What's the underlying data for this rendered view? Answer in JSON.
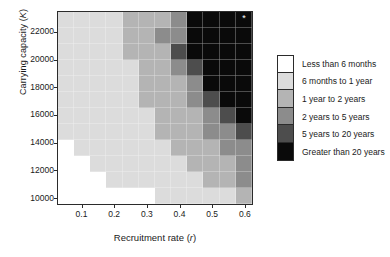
{
  "chart_data": {
    "type": "heatmap",
    "title": "",
    "xlabel": "Recruitment rate (r)",
    "ylabel": "Carrying capacity (K)",
    "xlabel_text": "Recruitment rate (",
    "xlabel_var": "r",
    "ylabel_text": "Carrying capacity (",
    "ylabel_var": "K",
    "xticks": [
      "0.1",
      "0.2",
      "0.3",
      "0.4",
      "0.5",
      "0.6"
    ],
    "xtick_values": [
      0.1,
      0.2,
      0.3,
      0.4,
      0.5,
      0.6
    ],
    "yticks": [
      "10000",
      "12000",
      "14000",
      "16000",
      "18000",
      "20000",
      "22000"
    ],
    "ytick_values": [
      10000,
      12000,
      14000,
      16000,
      18000,
      20000,
      22000
    ],
    "xlim": [
      0.025,
      0.625
    ],
    "ylim": [
      9500,
      23500
    ],
    "grid": true,
    "legend_position": "right",
    "ncols": 12,
    "nrows": 12,
    "x_centers": [
      0.05,
      0.1,
      0.15,
      0.2,
      0.25,
      0.3,
      0.35,
      0.4,
      0.45,
      0.5,
      0.55,
      0.6
    ],
    "y_centers": [
      23200,
      22000,
      20800,
      19600,
      18400,
      17200,
      16000,
      14800,
      13600,
      12400,
      11200,
      10000
    ],
    "value_levels": [
      0,
      1,
      2,
      3,
      4,
      5
    ],
    "colors": [
      "#ffffff",
      "#dcdcdc",
      "#b4b4b4",
      "#8c8c8c",
      "#4d4d4d",
      "#0a0a0a"
    ],
    "grid_values": [
      [
        1,
        1,
        1,
        1,
        2,
        2,
        2,
        3,
        5,
        5,
        5,
        5
      ],
      [
        1,
        1,
        1,
        1,
        2,
        2,
        3,
        3,
        5,
        5,
        5,
        5
      ],
      [
        1,
        1,
        1,
        1,
        2,
        2,
        2,
        4,
        5,
        5,
        5,
        5
      ],
      [
        1,
        1,
        1,
        1,
        1,
        2,
        2,
        3,
        4,
        5,
        5,
        5
      ],
      [
        1,
        1,
        1,
        1,
        1,
        2,
        2,
        2,
        3,
        5,
        5,
        5
      ],
      [
        1,
        1,
        1,
        1,
        1,
        2,
        2,
        2,
        3,
        4,
        5,
        5
      ],
      [
        1,
        1,
        1,
        1,
        1,
        1,
        2,
        2,
        2,
        3,
        4,
        5
      ],
      [
        1,
        1,
        1,
        1,
        1,
        1,
        2,
        2,
        2,
        3,
        3,
        4
      ],
      [
        0,
        1,
        1,
        1,
        1,
        1,
        1,
        2,
        2,
        2,
        3,
        3
      ],
      [
        0,
        0,
        1,
        1,
        1,
        1,
        1,
        1,
        2,
        2,
        2,
        3
      ],
      [
        0,
        0,
        0,
        1,
        1,
        1,
        1,
        1,
        1,
        2,
        2,
        3
      ],
      [
        0,
        0,
        0,
        0,
        0,
        0,
        1,
        1,
        1,
        1,
        1,
        2
      ]
    ],
    "annotations": [
      {
        "symbol": "*",
        "row": 0,
        "col": 11,
        "color": "#ffffff"
      }
    ],
    "legend": {
      "entries": [
        {
          "label": "Less than 6 months",
          "color": "#ffffff"
        },
        {
          "label": "6 months to 1 year",
          "color": "#dcdcdc"
        },
        {
          "label": "1 year to 2 years",
          "color": "#b4b4b4"
        },
        {
          "label": "2 years to 5 years",
          "color": "#8c8c8c"
        },
        {
          "label": "5 years to 20 years",
          "color": "#4d4d4d"
        },
        {
          "label": "Greater than 20 years",
          "color": "#0a0a0a"
        }
      ]
    }
  }
}
